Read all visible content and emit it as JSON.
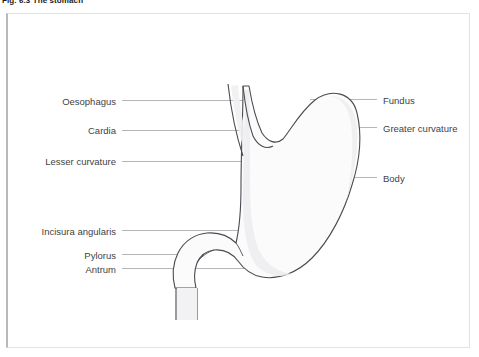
{
  "caption": {
    "text": "Fig. 6.3  The stomach"
  },
  "figure": {
    "title": "The stomach",
    "organ": "stomach",
    "fill_color": "#fbfbfb",
    "outline_color": "#4a4a50",
    "leader_color": "#b5b5ba",
    "frame_color": "#e2e2e4",
    "label_color": "#3f3f44"
  },
  "labels": {
    "left": [
      {
        "name": "oesophagus",
        "text": "Oesophagus",
        "x": 116,
        "y": 101
      },
      {
        "name": "cardia",
        "text": "Cardia",
        "x": 116,
        "y": 130
      },
      {
        "name": "lesser-curvature",
        "text": "Lesser curvature",
        "x": 116,
        "y": 161
      },
      {
        "name": "incisura-angularis",
        "text": "Incisura angularis",
        "x": 116,
        "y": 231
      },
      {
        "name": "pylorus",
        "text": "Pylorus",
        "x": 116,
        "y": 255
      },
      {
        "name": "antrum",
        "text": "Antrum",
        "x": 116,
        "y": 269
      }
    ],
    "right": [
      {
        "name": "fundus",
        "text": "Fundus",
        "x": 383,
        "y": 100
      },
      {
        "name": "greater-curvature",
        "text": "Greater curvature",
        "x": 383,
        "y": 128
      },
      {
        "name": "body",
        "text": "Body",
        "x": 383,
        "y": 178
      }
    ]
  }
}
